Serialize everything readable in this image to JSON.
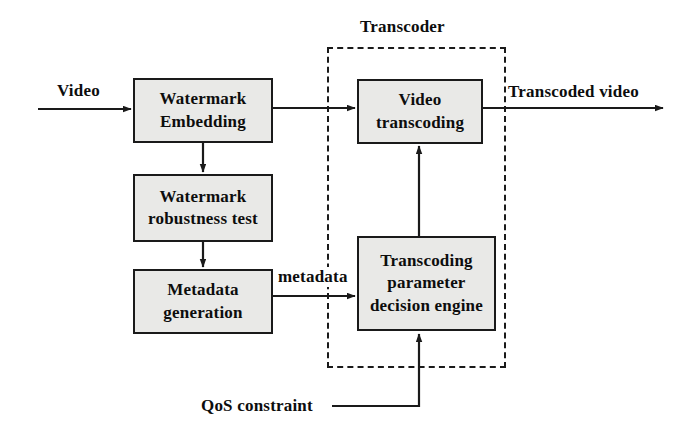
{
  "diagram": {
    "type": "block-flow-diagram",
    "background_color": "#ffffff",
    "node_fill_color": "#e9e9e7",
    "node_border_color": "#1a1a1a",
    "text_color": "#0d0d0d",
    "nodes": [
      {
        "id": "watermark-embedding",
        "lines": [
          "Watermark",
          "Embedding"
        ],
        "x": 133,
        "y": 78,
        "w": 140,
        "h": 65
      },
      {
        "id": "watermark-robustness-test",
        "lines": [
          "Watermark",
          "robustness test"
        ],
        "x": 133,
        "y": 174,
        "w": 140,
        "h": 68
      },
      {
        "id": "metadata-generation",
        "lines": [
          "Metadata",
          "generation"
        ],
        "x": 133,
        "y": 269,
        "w": 140,
        "h": 65
      },
      {
        "id": "video-transcoding",
        "lines": [
          "Video",
          "transcoding"
        ],
        "x": 357,
        "y": 79,
        "w": 126,
        "h": 65
      },
      {
        "id": "transcoding-parameter-decision-engine",
        "lines": [
          "Transcoding",
          "parameter",
          "decision engine"
        ],
        "x": 357,
        "y": 236,
        "w": 139,
        "h": 95
      }
    ],
    "group": {
      "id": "transcoder-group",
      "label": "Transcoder",
      "label_x": 360,
      "label_y": 17,
      "x": 327,
      "y": 47,
      "w": 179,
      "h": 321
    },
    "edge_labels": [
      {
        "id": "input-video-label",
        "text": "Video",
        "x": 56,
        "y": 81
      },
      {
        "id": "metadata-label",
        "text": "metadata",
        "x": 277,
        "y": 267
      },
      {
        "id": "output-transcoded-video-label",
        "text": "Transcoded video",
        "x": 507,
        "y": 82
      },
      {
        "id": "qos-constraint-label",
        "text": "QoS constraint",
        "x": 200,
        "y": 396
      }
    ],
    "connectors": [
      {
        "id": "video-to-watermark-embedding",
        "from": "Video input",
        "to": "watermark-embedding"
      },
      {
        "id": "watermark-embedding-to-video-transcoding",
        "from": "watermark-embedding",
        "to": "video-transcoding"
      },
      {
        "id": "watermark-embedding-to-robustness-test",
        "from": "watermark-embedding",
        "to": "watermark-robustness-test"
      },
      {
        "id": "robustness-test-to-metadata-generation",
        "from": "watermark-robustness-test",
        "to": "metadata-generation"
      },
      {
        "id": "metadata-generation-to-decision-engine",
        "from": "metadata-generation",
        "to": "transcoding-parameter-decision-engine"
      },
      {
        "id": "decision-engine-to-video-transcoding",
        "from": "transcoding-parameter-decision-engine",
        "to": "video-transcoding"
      },
      {
        "id": "qos-constraint-to-decision-engine",
        "from": "QoS constraint",
        "to": "transcoding-parameter-decision-engine"
      },
      {
        "id": "video-transcoding-to-output",
        "from": "video-transcoding",
        "to": "Transcoded video"
      }
    ]
  }
}
